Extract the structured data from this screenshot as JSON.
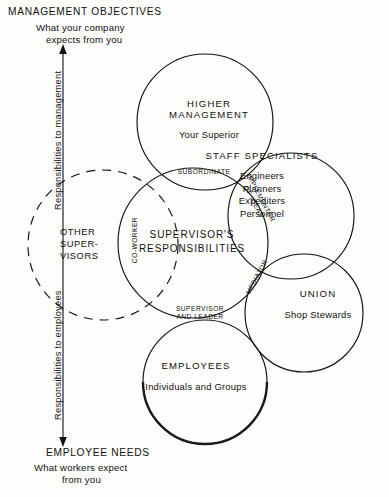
{
  "header": {
    "title": "MANAGEMENT OBJECTIVES",
    "sub_line1": "What your company",
    "sub_line2": "expects from you"
  },
  "footer": {
    "title": "EMPLOYEE NEEDS",
    "sub_line1": "What workers expect",
    "sub_line2": "from you"
  },
  "axis": {
    "up_label": "Responsibilities to management",
    "down_label": "Responsibilities to employees"
  },
  "circles": {
    "higher_management": {
      "heading": "HIGHER",
      "heading2": "MANAGEMENT",
      "subtitle": "Your Superior"
    },
    "staff_specialists": {
      "heading": "STAFF  SPECIALISTS",
      "items": [
        "Engineers",
        "Planners",
        "Expediters",
        "Personnel"
      ]
    },
    "union": {
      "heading": "UNION",
      "subtitle": "Shop Stewards"
    },
    "employees": {
      "heading": "EMPLOYEES",
      "subtitle": "Individuals and Groups"
    },
    "supervisor": {
      "heading": "SUPERVISOR'S",
      "heading2": "RESPONSIBILITIES"
    },
    "other_supervisors": {
      "line1": "OTHER",
      "line2": "SUPER-",
      "line3": "VISORS"
    }
  },
  "overlap_roles": {
    "subordinate": "SUBORDINATE",
    "co_worker": "CO-WORKER",
    "implementer_line1": "IMPLEMENTER",
    "implementer_line2": "OF IDEAS",
    "mediator": "MEDIATOR",
    "supervisor_leader_line1": "SUPERVISOR",
    "supervisor_leader_line2": "AND LEADER"
  },
  "colors": {
    "ink": "#111111",
    "paper": "#fdfdfc",
    "faint": "#c9c9c9"
  },
  "bottom_caption": ""
}
